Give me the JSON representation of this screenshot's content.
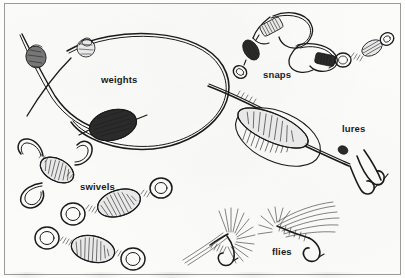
{
  "figure": {
    "caption": "",
    "border_color": "#9a9a9a",
    "background_color": "#fbfbfa",
    "ink_color": "#1a1a1a",
    "width": 405,
    "height": 278
  },
  "labels": [
    {
      "id": "weights",
      "text": "weights"
    },
    {
      "id": "snaps",
      "text": "snaps"
    },
    {
      "id": "lures",
      "text": "lures"
    },
    {
      "id": "swivels",
      "text": "swivels"
    },
    {
      "id": "flies",
      "text": "flies"
    }
  ],
  "illustrations": [
    {
      "group": "weights",
      "description": "fishing line loop with lead sinkers",
      "items": [
        "split-shot sinker",
        "small round sinker",
        "oval egg sinker"
      ]
    },
    {
      "group": "snaps",
      "description": "snap swivels with safety-pin clips",
      "items": [
        "snap swivel upper",
        "snap swivel lower"
      ]
    },
    {
      "group": "lures",
      "description": "spinner lure on line with treble hook",
      "items": [
        "spinner blade",
        "lure body",
        "treble hook"
      ]
    },
    {
      "group": "swivels",
      "description": "barrel and three-way swivels",
      "items": [
        "three-way swivel",
        "barrel swivel",
        "barrel swivel"
      ]
    },
    {
      "group": "flies",
      "description": "tied fishing flies with hackle",
      "items": [
        "dry fly",
        "wet fly"
      ]
    }
  ]
}
